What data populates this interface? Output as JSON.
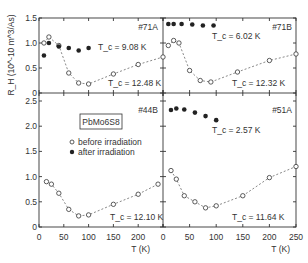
{
  "chart_data": [
    {
      "type": "scatter",
      "panel": "top-left",
      "label": "#71A",
      "title": "",
      "xlabel": "",
      "ylabel": "R_H (10^-10 m^3/As)",
      "xlim": [
        0,
        250
      ],
      "ylim": [
        0,
        1.5
      ],
      "yticks": [
        "0",
        "0.5",
        "1.0",
        "1.5"
      ],
      "series": [
        {
          "name": "before irradiation",
          "marker": "open-circle",
          "Tc": "T_c = 12.48 K",
          "x": [
            10,
            20,
            40,
            60,
            80,
            100,
            150,
            200,
            250
          ],
          "y": [
            1.0,
            1.12,
            0.95,
            0.4,
            0.2,
            0.18,
            0.38,
            0.57,
            0.72
          ]
        },
        {
          "name": "after irradiation",
          "marker": "filled-circle",
          "Tc": "T_c = 9.08 K",
          "x": [
            10,
            20,
            40,
            60,
            80,
            100
          ],
          "y": [
            0.75,
            1.0,
            0.93,
            0.9,
            0.85,
            0.9
          ]
        }
      ]
    },
    {
      "type": "scatter",
      "panel": "top-right",
      "label": "#71B",
      "xlim": [
        0,
        250
      ],
      "ylim": [
        0,
        1.5
      ],
      "series": [
        {
          "name": "before irradiation",
          "marker": "open-circle",
          "Tc": "T_c = 12.32 K",
          "x": [
            10,
            20,
            30,
            50,
            70,
            90,
            140,
            200,
            250
          ],
          "y": [
            0.95,
            1.05,
            1.0,
            0.45,
            0.25,
            0.22,
            0.42,
            0.65,
            0.78
          ]
        },
        {
          "name": "after irradiation",
          "marker": "filled-circle",
          "Tc": "T_c = 6.02 K",
          "x": [
            10,
            20,
            35,
            55,
            75,
            95
          ],
          "y": [
            1.38,
            1.38,
            1.38,
            1.37,
            1.35,
            1.35
          ]
        }
      ]
    },
    {
      "type": "scatter",
      "panel": "bottom-left",
      "label": "#44B",
      "material": "PbMo6S8",
      "xlabel": "T (K)",
      "xlim": [
        0,
        250
      ],
      "ylim": [
        0,
        2.5
      ],
      "xticks": [
        "0",
        "50",
        "100",
        "150",
        "200"
      ],
      "yticks": [
        "0",
        "0.5",
        "1.0",
        "1.5",
        "2.0",
        "2.5"
      ],
      "series": [
        {
          "name": "before irradiation",
          "marker": "open-circle",
          "Tc": "T_c = 12.10 K",
          "x": [
            15,
            25,
            40,
            60,
            80,
            100,
            150,
            200,
            240
          ],
          "y": [
            0.9,
            0.85,
            0.67,
            0.35,
            0.22,
            0.24,
            0.45,
            0.65,
            0.85
          ]
        }
      ]
    },
    {
      "type": "scatter",
      "panel": "bottom-right",
      "label": "#51A",
      "xlabel": "T (K)",
      "xlim": [
        0,
        250
      ],
      "ylim": [
        0,
        2.5
      ],
      "xticks": [
        "0",
        "50",
        "100",
        "150",
        "200",
        "250"
      ],
      "series": [
        {
          "name": "before irradiation",
          "marker": "open-circle",
          "Tc": "T_c = 11.64 K",
          "x": [
            15,
            25,
            40,
            60,
            80,
            100,
            150,
            200,
            250
          ],
          "y": [
            1.12,
            0.95,
            0.62,
            0.5,
            0.38,
            0.42,
            0.62,
            0.98,
            1.2
          ]
        },
        {
          "name": "after irradiation",
          "marker": "filled-circle",
          "Tc": "T_c = 2.57 K",
          "x": [
            15,
            25,
            40,
            60,
            80,
            100
          ],
          "y": [
            2.32,
            2.35,
            2.33,
            2.27,
            2.2,
            2.12
          ]
        }
      ]
    }
  ],
  "labels": {
    "ylabel": "R_H (10^-10 m^3/As)",
    "xlabel": "T (K)",
    "material": "PbMo6S8",
    "legend_before": "before irradiation",
    "legend_after": "after irradiation"
  }
}
